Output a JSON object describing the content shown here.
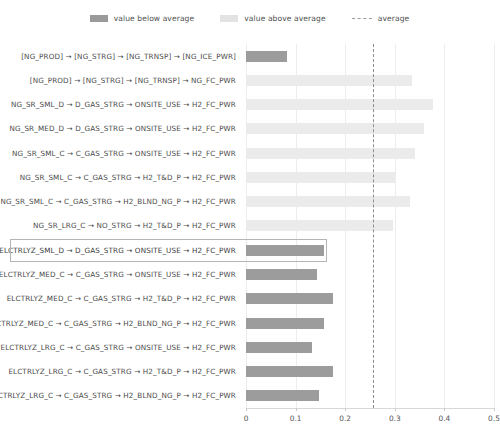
{
  "legend": {
    "items": [
      {
        "label": "value below average",
        "swatch": "below-average-swatch",
        "color": "#9a9a9a"
      },
      {
        "label": "value above average",
        "swatch": "above-average-swatch",
        "color": "#e3e3e3"
      },
      {
        "label": "average",
        "swatch": "average-dashed-line",
        "color": "#8d8d8d"
      }
    ]
  },
  "chart_data": {
    "type": "bar",
    "orientation": "horizontal",
    "title": "",
    "xlabel": "",
    "ylabel": "",
    "xlim": [
      0,
      0.5
    ],
    "xticks": [
      "0",
      "0.1",
      "0.2",
      "0.3",
      "0.4",
      "0.5"
    ],
    "xtick_values": [
      0,
      0.1,
      0.2,
      0.3,
      0.4,
      0.5
    ],
    "grid": true,
    "legend_position": "top-center",
    "average": 0.257,
    "highlighted_category": "ELCTRLYZ_SML_D → D_GAS_STRG → ONSITE_USE → H2_FC_PWR",
    "categories": [
      "[NG_PROD] → [NG_STRG] → [NG_TRNSP] → [NG_ICE_PWR]",
      "[NG_PROD] → [NG_STRG] → [NG_TRNSP] → NG_FC_PWR",
      "NG_SR_SML_D → D_GAS_STRG → ONSITE_USE → H2_FC_PWR",
      "NG_SR_MED_D → D_GAS_STRG → ONSITE_USE → H2_FC_PWR",
      "NG_SR_SML_C → C_GAS_STRG → ONSITE_USE → H2_FC_PWR",
      "NG_SR_SML_C → C_GAS_STRG → H2_T&D_P → H2_FC_PWR",
      "NG_SR_SML_C → C_GAS_STRG → H2_BLND_NG_P → H2_FC_PWR",
      "NG_SR_LRG_C → NO_STRG → H2_T&D_P → H2_FC_PWR",
      "ELCTRLYZ_SML_D → D_GAS_STRG → ONSITE_USE → H2_FC_PWR",
      "ELCTRLYZ_MED_C → C_GAS_STRG → ONSITE_USE → H2_FC_PWR",
      "ELCTRLYZ_MED_C → C_GAS_STRG → H2_T&D_P → H2_FC_PWR",
      "ELCTRLYZ_MED_C → C_GAS_STRG → H2_BLND_NG_P → H2_FC_PWR",
      "ELCTRLYZ_LRG_C → C_GAS_STRG → ONSITE_USE → H2_FC_PWR",
      "ELCTRLYZ_LRG_C → C_GAS_STRG → H2_T&D_P → H2_FC_PWR",
      "ELCTRLYZ_LRG_C → C_GAS_STRG → H2_BLND_NG_P → H2_FC_PWR"
    ],
    "values": [
      0.082,
      0.334,
      0.378,
      0.358,
      0.34,
      0.3,
      0.33,
      0.296,
      0.158,
      0.143,
      0.176,
      0.158,
      0.133,
      0.176,
      0.148
    ],
    "series": [
      {
        "name": "value",
        "values": [
          0.082,
          0.334,
          0.378,
          0.358,
          0.34,
          0.3,
          0.33,
          0.296,
          0.158,
          0.143,
          0.176,
          0.158,
          0.133,
          0.176,
          0.148
        ]
      }
    ],
    "bar_classes": [
      "below",
      "above",
      "above",
      "above",
      "above",
      "above",
      "above",
      "above",
      "below",
      "below",
      "below",
      "below",
      "below",
      "below",
      "below"
    ]
  }
}
